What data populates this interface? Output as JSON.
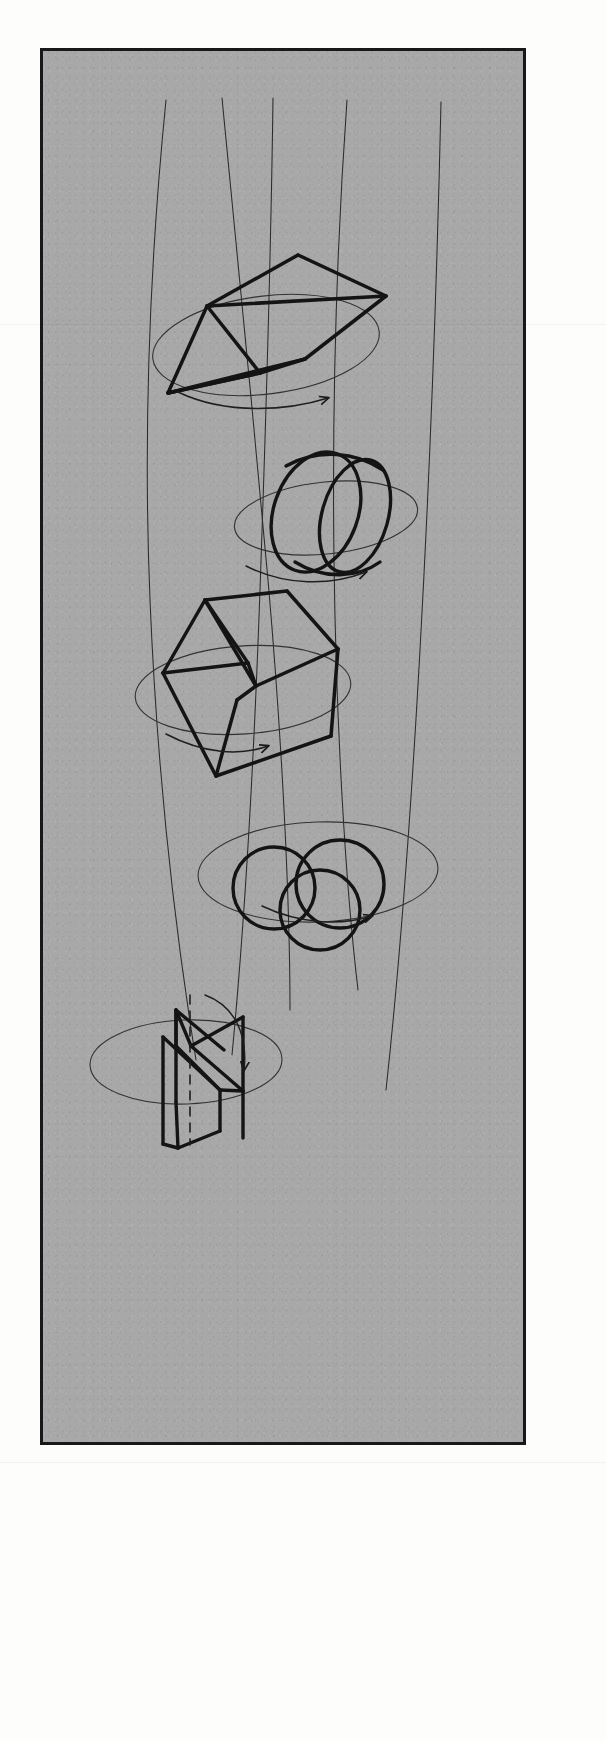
{
  "page": {
    "background_color": "#fdfdfc",
    "width": 606,
    "height": 1740
  },
  "panel": {
    "name": "drawing-panel",
    "fill_color": "#a8a8a8",
    "border_color": "#18181a",
    "border_width": 3,
    "x": 40,
    "y": 48,
    "width": 486,
    "height": 1397,
    "texture": "grainy paper / photocopy noise"
  },
  "drawing": {
    "medium": "ink pen line drawing",
    "stroke_color_heavy": "#141414",
    "stroke_color_light": "#2a2a2a",
    "heavy_stroke_width": 3.4,
    "light_stroke_width": 0.9,
    "description": "Five three-dimensional geometric solids stacked vertically, each shown spinning about a vertical axis. Thin long curved lines sweep down the sheet as rotation axes / trajectories; each solid sits on a light horizontal ellipse denoting its plane of rotation and is accompanied by a thin curved arrow showing the direction of spin.",
    "axis_lines": [
      {
        "name": "axis-line-1",
        "d": "M 166 100 C 150 260, 143 430, 150 600 C 157 770, 175 930, 196 1060"
      },
      {
        "name": "axis-line-2",
        "d": "M 222 98 C 236 250, 254 420, 268 580 C 282 740, 290 900, 290 1010"
      },
      {
        "name": "axis-line-3",
        "d": "M 273 98 C 271 250, 266 420, 260 590 C 254 760, 244 930, 232 1055"
      },
      {
        "name": "axis-line-4",
        "d": "M 347 100 C 337 240, 332 400, 334 560 C 336 720, 345 880, 358 990"
      },
      {
        "name": "axis-line-5",
        "d": "M 441 102 C 437 280, 430 470, 420 650 C 410 830, 398 980, 386 1090"
      }
    ],
    "solids": [
      {
        "index": 1,
        "name": "faceted-wedge",
        "label": "faceted wedge / kite solid",
        "center": {
          "x": 272,
          "y": 330
        },
        "rotation_ellipse": {
          "cx": 266,
          "cy": 345,
          "rx": 114,
          "ry": 49,
          "rotation_deg": -7
        },
        "spin_arrow": {
          "name": "spin-arrow-1",
          "d": "M 178 392 C 228 416, 290 410, 328 398",
          "arrow_at": "right"
        },
        "outline": "M 168 393 L 207 306 L 298 255 L 386 296 L 305 359 L 260 373 Z",
        "edges": [
          "M 168 393 L 207 306",
          "M 207 306 L 298 255",
          "M 298 255 L 386 296",
          "M 386 296 L 305 359",
          "M 305 359 L 260 373",
          "M 260 373 L 168 393",
          "M 207 306 L 260 373",
          "M 168 393 L 260 373",
          "M 168 393 L 305 359",
          "M 207 306 L 386 296"
        ]
      },
      {
        "index": 2,
        "name": "tilted-cylinder-ring",
        "label": "tilted open cylinder / ring",
        "center": {
          "x": 327,
          "y": 513
        },
        "rotation_ellipse": {
          "cx": 326,
          "cy": 518,
          "rx": 92,
          "ry": 36,
          "rotation_deg": -6
        },
        "spin_arrow": {
          "name": "spin-arrow-2",
          "d": "M 246 566 C 286 586, 330 586, 366 572",
          "arrow_at": "right"
        },
        "parts": [
          "near rim ellipse",
          "far rim ellipse",
          "top connecting edge",
          "bottom connecting edge"
        ]
      },
      {
        "index": 3,
        "name": "cube",
        "label": "cube in three-quarter view",
        "center": {
          "x": 248,
          "y": 685
        },
        "rotation_ellipse": {
          "cx": 243,
          "cy": 690,
          "rx": 108,
          "ry": 44,
          "rotation_deg": -4
        },
        "spin_arrow": {
          "name": "spin-arrow-3",
          "d": "M 166 734 C 204 754, 240 756, 268 746",
          "arrow_at": "right"
        },
        "vertices": {
          "front_top": {
            "x": 205,
            "y": 600
          },
          "top_back": {
            "x": 285,
            "y": 592
          },
          "right_top": {
            "x": 336,
            "y": 648
          },
          "center_mid": {
            "x": 252,
            "y": 686
          },
          "left_mid": {
            "x": 163,
            "y": 672
          },
          "bottom": {
            "x": 216,
            "y": 775
          },
          "right_bottom": {
            "x": 330,
            "y": 735
          }
        }
      },
      {
        "index": 4,
        "name": "sphere-cluster",
        "label": "cluster of three intersecting spheres",
        "center": {
          "x": 318,
          "y": 890
        },
        "rotation_ellipse": {
          "cx": 318,
          "cy": 872,
          "rx": 120,
          "ry": 50,
          "rotation_deg": -2
        },
        "spin_arrow": {
          "name": "spin-arrow-4",
          "d": "M 262 906 C 300 924, 340 926, 372 916",
          "arrow_at": "right"
        },
        "circles": [
          {
            "cx": 274,
            "cy": 888,
            "r": 41
          },
          {
            "cx": 340,
            "cy": 884,
            "r": 44
          },
          {
            "cx": 320,
            "cy": 910,
            "r": 40
          }
        ]
      },
      {
        "index": 5,
        "name": "folded-planes",
        "label": "pair of folded intersecting planes / vane",
        "center": {
          "x": 188,
          "y": 1060
        },
        "rotation_ellipse": {
          "cx": 186,
          "cy": 1062,
          "rx": 96,
          "ry": 42,
          "rotation_deg": -2
        },
        "spin_arrow": {
          "name": "spin-arrow-5",
          "d": "M 205 995 C 235 1006, 248 1035, 244 1070",
          "arrow_at": "bottom"
        },
        "dashed_axis": {
          "name": "vane-dashed-axis",
          "x": 190,
          "y1": 995,
          "y2": 1145
        },
        "parts": [
          "left vertical vane panel",
          "right vertical vane panel",
          "upper triangular fold",
          "dashed central rotation axis"
        ]
      }
    ]
  }
}
